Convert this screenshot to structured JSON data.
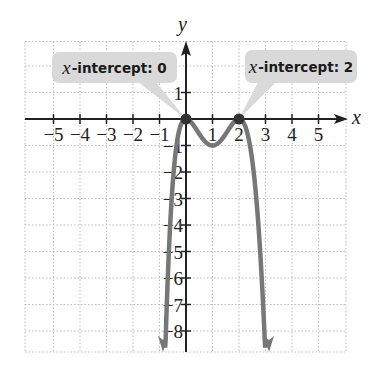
{
  "chart_data": {
    "type": "line",
    "title": "",
    "function": "f(x) = -x^2 (x - 2)^2",
    "xlabel": "x",
    "ylabel": "y",
    "xlim": [
      -6,
      6
    ],
    "ylim": [
      -9,
      3
    ],
    "x_ticks": [
      -5,
      -4,
      -3,
      -2,
      -1,
      1,
      2,
      3,
      4,
      5
    ],
    "x_tick_labels": [
      "−5",
      "−4",
      "−3",
      "−2",
      "−1",
      "1",
      "2",
      "3",
      "4",
      "5"
    ],
    "y_ticks": [
      1,
      -1,
      -2,
      -3,
      -4,
      -5,
      -6,
      -7,
      -8
    ],
    "y_tick_labels": [
      "1",
      "−1",
      "−2",
      "−3",
      "−4",
      "−5",
      "−6",
      "−7",
      "−8"
    ],
    "grid": true,
    "series": [
      {
        "name": "f(x)",
        "points": [
          {
            "x": -0.85,
            "y": -8.7
          },
          {
            "x": -0.6,
            "y": -2.45
          },
          {
            "x": -0.4,
            "y": -0.92
          },
          {
            "x": -0.2,
            "y": -0.19
          },
          {
            "x": 0,
            "y": 0
          },
          {
            "x": 0.5,
            "y": -0.56
          },
          {
            "x": 1,
            "y": -1
          },
          {
            "x": 1.5,
            "y": -0.56
          },
          {
            "x": 2,
            "y": 0
          },
          {
            "x": 2.2,
            "y": -0.19
          },
          {
            "x": 2.4,
            "y": -0.92
          },
          {
            "x": 2.6,
            "y": -2.43
          },
          {
            "x": 2.85,
            "y": -5.9
          },
          {
            "x": 3.1,
            "y": -8.7
          }
        ],
        "color": "#777777"
      }
    ],
    "x_intercepts": [
      0,
      2
    ],
    "annotations": [
      {
        "text": "x-intercept: 0",
        "target": {
          "x": 0,
          "y": 0
        }
      },
      {
        "text": "x-intercept: 2",
        "target": {
          "x": 2,
          "y": 0
        }
      }
    ]
  },
  "labels": {
    "x_axis": "x",
    "y_axis": "y",
    "callout1_var": "x",
    "callout1_text": "-intercept: 0",
    "callout2_var": "x",
    "callout2_text": "-intercept: 2"
  }
}
